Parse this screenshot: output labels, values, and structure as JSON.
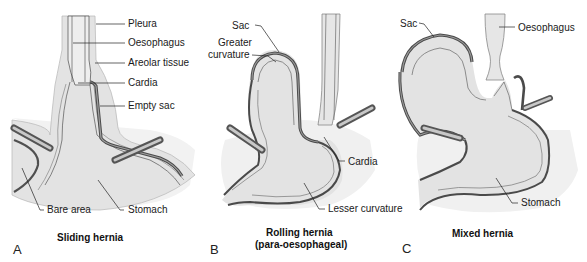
{
  "figure": {
    "panels": [
      {
        "letter": "A",
        "title": "Sliding hernia",
        "labels": {
          "pleura": "Pleura",
          "oesophagus": "Oesophagus",
          "areolar": "Areolar tissue",
          "cardia": "Cardia",
          "empty_sac": "Empty sac",
          "bare_area": "Bare area",
          "stomach": "Stomach"
        }
      },
      {
        "letter": "B",
        "title_line1": "Rolling hernia",
        "title_line2": "(para-oesophageal)",
        "labels": {
          "sac": "Sac",
          "greater_line1": "Greater",
          "greater_line2": "curvature",
          "cardia": "Cardia",
          "lesser": "Lesser curvature"
        }
      },
      {
        "letter": "C",
        "title": "Mixed hernia",
        "labels": {
          "sac": "Sac",
          "oesophagus": "Oesophagus",
          "stomach": "Stomach"
        }
      }
    ],
    "colors": {
      "tissue_fill": "#e4e4e4",
      "tissue_light": "#efefef",
      "wall_dark": "#555555",
      "sac_layer": "#8a8a8a",
      "outline": "#3a3a3a",
      "leader": "#222222"
    }
  }
}
